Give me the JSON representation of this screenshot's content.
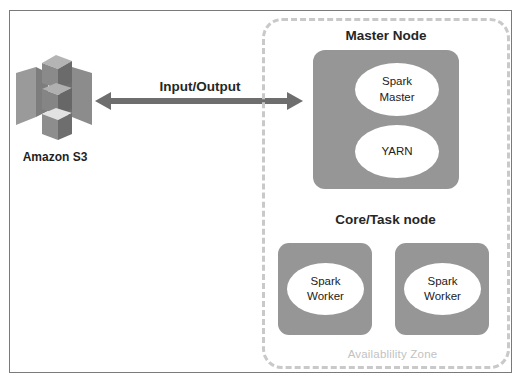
{
  "diagram": {
    "colors": {
      "node_fill": "#969696",
      "ellipse_fill": "#ffffff",
      "dashed_border": "#c9c9c9",
      "az_label_text": "#c2c2c2",
      "frame_border": "#7a7a7a",
      "arrow": "#6e6e6e",
      "heading_text": "#262626",
      "s3_icon_light": "#b0b0b0",
      "s3_icon_mid": "#8f8f8f",
      "s3_icon_dark": "#6f6f6f"
    }
  },
  "storage": {
    "label": "Amazon S3",
    "icon": "amazon-s3-icon"
  },
  "connection": {
    "label": "Input/Output",
    "icon": "double-headed-arrow-icon"
  },
  "availability_zone": {
    "label": "Availablility Zone"
  },
  "master": {
    "title": "Master Node",
    "components": [
      {
        "label_line1": "Spark",
        "label_line2": "Master"
      },
      {
        "label_line1": "YARN",
        "label_line2": ""
      }
    ]
  },
  "core_task": {
    "title": "Core/Task node",
    "nodes": [
      {
        "label_line1": "Spark",
        "label_line2": "Worker"
      },
      {
        "label_line1": "Spark",
        "label_line2": "Worker"
      }
    ]
  }
}
